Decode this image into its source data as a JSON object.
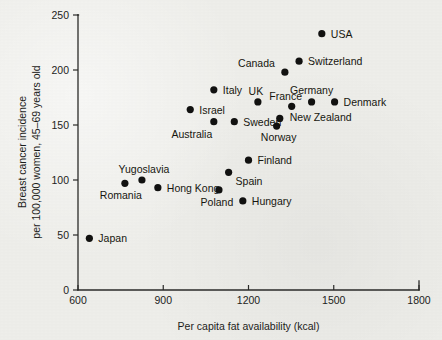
{
  "chart_data": {
    "type": "scatter",
    "title": "",
    "subtitle": "",
    "xlabel": "Per capita fat availability (kcal)",
    "ylabel": "Breast cancer incidence per 100,000 women, 45–69 years old",
    "ylabel_line1": "Breast cancer incidence",
    "ylabel_line2": "per 100,000 women, 45–69 years old",
    "xlim": [
      600,
      1800
    ],
    "ylim": [
      0,
      250
    ],
    "xticks": [
      600,
      900,
      1200,
      1500,
      1800
    ],
    "yticks": [
      0,
      50,
      100,
      150,
      200,
      250
    ],
    "xtick_labels": [
      "600",
      "900",
      "1200",
      "1500",
      "1800"
    ],
    "ytick_labels": [
      "0",
      "50",
      "100",
      "150",
      "200",
      "250"
    ],
    "grid": false,
    "legend": false,
    "legend_position": "none",
    "marker_color": "#111110",
    "axis_color": "#2a2a28",
    "background_color": "#eeeeea",
    "points": [
      {
        "label": "Japan",
        "x": 640,
        "y": 47,
        "label_dx": 9,
        "label_dy": 4,
        "anchor": "start"
      },
      {
        "label": "Romania",
        "x": 765,
        "y": 97,
        "label_dx": -4,
        "label_dy": 16,
        "anchor": "middle"
      },
      {
        "label": "Yugoslavia",
        "x": 825,
        "y": 100,
        "label_dx": 2,
        "label_dy": -7,
        "anchor": "middle"
      },
      {
        "label": "Hong Kong",
        "x": 881,
        "y": 93,
        "label_dx": 9,
        "label_dy": 4,
        "anchor": "start"
      },
      {
        "label": "Poland",
        "x": 1096,
        "y": 91,
        "label_dx": -2,
        "label_dy": 16,
        "anchor": "middle"
      },
      {
        "label": "Hungary",
        "x": 1180,
        "y": 81,
        "label_dx": 9,
        "label_dy": 4,
        "anchor": "start"
      },
      {
        "label": "Spain",
        "x": 1130,
        "y": 107,
        "label_dx": 7,
        "label_dy": 13,
        "anchor": "start"
      },
      {
        "label": "Finland",
        "x": 1200,
        "y": 118,
        "label_dx": 9,
        "label_dy": 4,
        "anchor": "start"
      },
      {
        "label": "Israel",
        "x": 995,
        "y": 164,
        "label_dx": 9,
        "label_dy": 4,
        "anchor": "start"
      },
      {
        "label": "Australia",
        "x": 1078,
        "y": 153,
        "label_dx": -22,
        "label_dy": 16,
        "anchor": "middle"
      },
      {
        "label": "Italy",
        "x": 1078,
        "y": 182,
        "label_dx": 9,
        "label_dy": 4,
        "anchor": "start"
      },
      {
        "label": "Sweden",
        "x": 1150,
        "y": 153,
        "label_dx": 9,
        "label_dy": 4,
        "anchor": "start"
      },
      {
        "label": "UK",
        "x": 1233,
        "y": 171,
        "label_dx": -2,
        "label_dy": -7,
        "anchor": "middle"
      },
      {
        "label": "France",
        "x": 1352,
        "y": 167,
        "label_dx": -6,
        "label_dy": -6,
        "anchor": "middle"
      },
      {
        "label": "Norway",
        "x": 1299,
        "y": 149,
        "label_dx": 2,
        "label_dy": 15,
        "anchor": "middle"
      },
      {
        "label": "New Zealand",
        "x": 1310,
        "y": 156,
        "label_dx": 10,
        "label_dy": 3,
        "anchor": "start"
      },
      {
        "label": "Germany",
        "x": 1422,
        "y": 171,
        "label_dx": 0,
        "label_dy": -8,
        "anchor": "middle"
      },
      {
        "label": "Denmark",
        "x": 1503,
        "y": 171,
        "label_dx": 9,
        "label_dy": 4,
        "anchor": "start"
      },
      {
        "label": "Canada",
        "x": 1328,
        "y": 198,
        "label_dx": -10,
        "label_dy": -5,
        "anchor": "end"
      },
      {
        "label": "Switzerland",
        "x": 1378,
        "y": 208,
        "label_dx": 9,
        "label_dy": 4,
        "anchor": "start"
      },
      {
        "label": "USA",
        "x": 1458,
        "y": 233,
        "label_dx": 9,
        "label_dy": 4,
        "anchor": "start"
      }
    ]
  }
}
